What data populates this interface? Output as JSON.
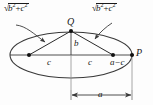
{
  "figure": {
    "kind": "geometry-diagram",
    "background_color": "#fdfdfd",
    "stroke_color": "#3a3a3a",
    "text_color": "#1a1a1a"
  },
  "labels": {
    "point_q": "Q",
    "point_p": "P",
    "semi_minor": "b",
    "focal_left": "c",
    "focal_right": "c",
    "vertex_gap": "a−c",
    "semi_major": "a",
    "radical_left": "√(b² + c²)",
    "radical_right": "√(b² + c²)"
  },
  "radical_parts": {
    "sign": "√",
    "term1_base": "b",
    "term1_exp": "2",
    "operator": "+",
    "term2_base": "c",
    "term2_exp": "2"
  },
  "geometry": {
    "ellipse_center_x": 71,
    "ellipse_center_y": 55,
    "ellipse_rx": 61,
    "ellipse_ry": 23,
    "focus_left_x": 29,
    "focus_right_x": 113,
    "focus_y": 55,
    "apex_x": 71,
    "apex_y": 31,
    "vertex_p_x": 132,
    "vertex_p_y": 55,
    "dimension_y": 95,
    "dimension_x_start": 71,
    "dimension_x_end": 132
  }
}
